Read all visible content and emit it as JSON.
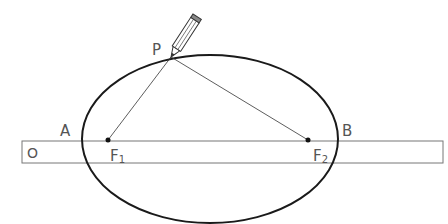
{
  "diagram": {
    "labels": {
      "P": "P",
      "A": "A",
      "B": "B",
      "O": "O",
      "F1": "F",
      "F1_sub": "1",
      "F2": "F",
      "F2_sub": "2"
    },
    "points": {
      "P": [
        171,
        57
      ],
      "F1": [
        108,
        140
      ],
      "F2": [
        308,
        140
      ]
    },
    "ellipse": {
      "cx": 210,
      "cy": 139,
      "rx": 128,
      "ry": 84
    },
    "ruler": {
      "x": 22,
      "y": 141,
      "width": 421,
      "height": 22
    },
    "colors": {
      "stroke": "#1a1a1a",
      "label": "#555555",
      "ruler": "#777777"
    }
  }
}
